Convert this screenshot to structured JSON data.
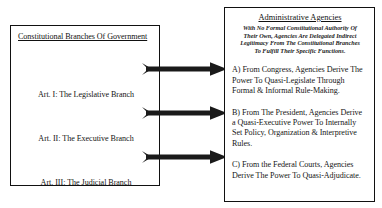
{
  "left_panel": {
    "title": "Constitutional Branches Of Government",
    "branches": [
      {
        "label": "Art. I: The Legislative Branch"
      },
      {
        "label": "Art. II: The Executive Branch"
      },
      {
        "label": "Art. III: The Judicial Branch"
      }
    ]
  },
  "arrows": [
    {
      "name": "arrow-legislative-to-agencies"
    },
    {
      "name": "arrow-executive-to-agencies"
    },
    {
      "name": "arrow-judicial-to-agencies"
    }
  ],
  "right_panel": {
    "title": "Administrative Agencies",
    "subtitle_lines": [
      "With No Formal Constitutional Authority Of",
      "Their Own, Agencies Are Delegated Indirect",
      "Legitimacy From The Constitutional Branches",
      "To  Fulfill Their Specific Functions."
    ],
    "paragraphs": [
      {
        "id": "A",
        "lines": [
          "A) From Congress, Agencies Derive The",
          "Power To Quasi-Legislate Through",
          "Formal & Informal Rule-Making."
        ]
      },
      {
        "id": "B",
        "lines": [
          "B) From The President, Agencies Derive",
          "a Quasi-Executive Power To Internally",
          "Set Policy, Organization & Interpretive",
          "Rules."
        ]
      },
      {
        "id": "C",
        "lines": [
          "C) From the Federal Courts, Agencies",
          "Derive The Power To Quasi-Adjudicate."
        ]
      }
    ]
  },
  "colors": {
    "ink": "#111111",
    "background": "#ffffff",
    "arrow": "#1a1a1a"
  }
}
